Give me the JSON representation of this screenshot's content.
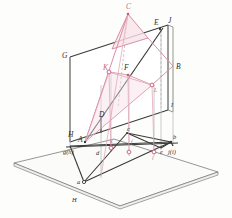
{
  "figure": {
    "kind": "descriptive-geometry-projection-diagram",
    "title": "",
    "colors": {
      "dark_line": "#3a3a3a",
      "plane_edge": "#555555",
      "pink_line": "#d98fa6",
      "pink_strong": "#c9577c",
      "pink_fill": "#f6dde4",
      "gray_projector": "#b9b9b9",
      "ground_plane_fill": "#fbfbfa",
      "vertical_plane_fill": "#ffffff",
      "label_color": "#2e2e2e",
      "label_pink": "#c46a86"
    },
    "labels": [
      {
        "id": "C",
        "text": "C",
        "x": 126,
        "y": 5,
        "color": "pink"
      },
      {
        "id": "E",
        "text": "E",
        "x": 155,
        "y": 22,
        "color": "dark"
      },
      {
        "id": "J_top",
        "text": "J",
        "x": 168,
        "y": 20,
        "color": "dark"
      },
      {
        "id": "G",
        "text": "G",
        "x": 63,
        "y": 54,
        "color": "dark"
      },
      {
        "id": "K",
        "text": "K",
        "x": 104,
        "y": 66,
        "color": "pink"
      },
      {
        "id": "F",
        "text": "F",
        "x": 125,
        "y": 66,
        "color": "dark"
      },
      {
        "id": "B",
        "text": "B",
        "x": 175,
        "y": 65,
        "color": "dark"
      },
      {
        "id": "L",
        "text": "L",
        "x": 155,
        "y": 89,
        "color": "pink"
      },
      {
        "id": "I",
        "text": "I",
        "x": 171,
        "y": 106,
        "color": "dark"
      },
      {
        "id": "D",
        "text": "D",
        "x": 100,
        "y": 114,
        "color": "dark"
      },
      {
        "id": "H",
        "text": "H",
        "x": 70,
        "y": 135,
        "color": "dark"
      },
      {
        "id": "A",
        "text": "A",
        "x": 79,
        "y": 140,
        "color": "dark"
      },
      {
        "id": "c",
        "text": "c",
        "x": 128,
        "y": 131,
        "color": "dark"
      },
      {
        "id": "b",
        "text": "b",
        "x": 172,
        "y": 138,
        "color": "dark"
      },
      {
        "id": "gh",
        "text": "g(h)",
        "x": 64,
        "y": 152,
        "color": "dark"
      },
      {
        "id": "d",
        "text": "d",
        "x": 97,
        "y": 153,
        "color": "dark"
      },
      {
        "id": "k",
        "text": "k",
        "x": 110,
        "y": 141,
        "color": "pink"
      },
      {
        "id": "f",
        "text": "f",
        "x": 131,
        "y": 142,
        "color": "pink"
      },
      {
        "id": "l",
        "text": "l",
        "x": 152,
        "y": 158,
        "color": "pink"
      },
      {
        "id": "e",
        "text": "e",
        "x": 160,
        "y": 152,
        "color": "dark"
      },
      {
        "id": "ji",
        "text": "j(i)",
        "x": 169,
        "y": 152,
        "color": "dark"
      },
      {
        "id": "a",
        "text": "a",
        "x": 79,
        "y": 180,
        "color": "dark"
      },
      {
        "id": "H_gp",
        "text": "H",
        "x": 73,
        "y": 200,
        "color": "dark"
      }
    ],
    "points": [
      {
        "id": "C",
        "x": 128,
        "y": 14,
        "style": "pink-dot"
      },
      {
        "id": "E",
        "x": 158,
        "y": 30,
        "style": "dark-dot"
      },
      {
        "id": "K",
        "x": 109,
        "y": 72,
        "style": "pink-ring"
      },
      {
        "id": "F",
        "x": 128,
        "y": 75,
        "style": "pink-dot"
      },
      {
        "id": "L",
        "x": 152,
        "y": 85,
        "style": "pink-ring"
      },
      {
        "id": "A",
        "x": 85,
        "y": 142,
        "style": "dark-dot"
      },
      {
        "id": "k",
        "x": 111,
        "y": 148,
        "style": "pink-ring"
      },
      {
        "id": "f",
        "x": 129,
        "y": 152,
        "style": "pink-ring"
      },
      {
        "id": "l",
        "x": 154,
        "y": 152,
        "style": "pink-ring"
      },
      {
        "id": "a",
        "x": 84,
        "y": 182,
        "style": "dark-dot"
      }
    ]
  }
}
